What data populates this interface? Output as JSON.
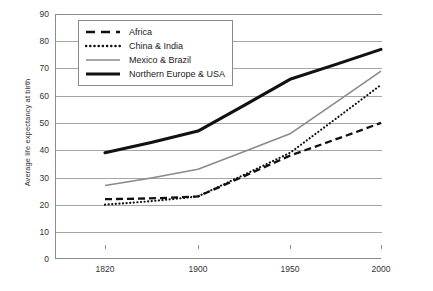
{
  "chart_data": {
    "type": "line",
    "title": "",
    "xlabel": "",
    "ylabel": "Average life expectancy at birth",
    "x": [
      1820,
      1900,
      1950,
      2000
    ],
    "xticks": [
      "1820",
      "1900",
      "1950",
      "2000"
    ],
    "xlim": [
      1790,
      2015
    ],
    "ylim": [
      0,
      90
    ],
    "yticks": [
      "0",
      "10",
      "20",
      "30",
      "40",
      "50",
      "60",
      "70",
      "80",
      "90"
    ],
    "ytick_values": [
      0,
      10,
      20,
      30,
      40,
      50,
      60,
      70,
      80,
      90
    ],
    "grid": "horizontal",
    "legend_position": "top-left-inside",
    "series": [
      {
        "name": "Africa",
        "style": "dashed",
        "color": "#111111",
        "values": [
          22,
          23,
          38,
          50
        ]
      },
      {
        "name": "China & India",
        "style": "dotted",
        "color": "#111111",
        "values": [
          20,
          23,
          39,
          64
        ]
      },
      {
        "name": "Mexico & Brazil",
        "style": "solid-thin",
        "color": "#8a8a8a",
        "values": [
          27,
          33,
          46,
          69
        ]
      },
      {
        "name": "Northern Europe & USA",
        "style": "solid-thick",
        "color": "#111111",
        "values": [
          39,
          47,
          66,
          77
        ]
      }
    ]
  },
  "legend": {
    "items": [
      {
        "label": "Africa"
      },
      {
        "label": "China & India"
      },
      {
        "label": "Mexico & Brazil"
      },
      {
        "label": "Northern Europe & USA"
      }
    ]
  },
  "caption": {
    "text": ""
  },
  "colors": {
    "axis": "#8c8c8c",
    "grid": "#a6a6a6",
    "dark_series": "#111111",
    "gray_series": "#8a8a8a",
    "background": "#ffffff"
  }
}
